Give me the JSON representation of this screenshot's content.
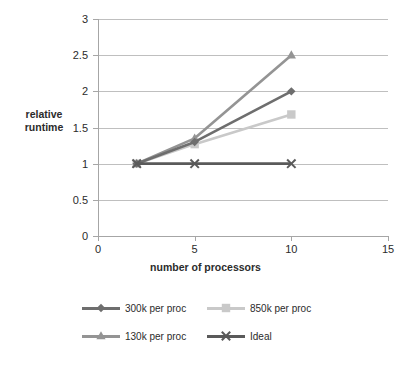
{
  "chart_data": {
    "type": "line",
    "title": "",
    "xlabel": "number of processors",
    "ylabel": "relative runtime",
    "x": [
      2,
      5,
      10
    ],
    "xlim": [
      0,
      15
    ],
    "ylim": [
      0,
      3
    ],
    "xticks": [
      "0",
      "5",
      "10",
      "15"
    ],
    "xtick_values": [
      0,
      5,
      10,
      15
    ],
    "yticks": [
      "0",
      "0.5",
      "1",
      "1.5",
      "2",
      "2.5",
      "3"
    ],
    "ytick_values": [
      0,
      0.5,
      1,
      1.5,
      2,
      2.5,
      3
    ],
    "grid": "horizontal",
    "legend_position": "bottom",
    "series": [
      {
        "name": "300k per proc",
        "values": [
          1,
          1.3,
          2
        ],
        "color": "#6e6e6e",
        "marker": "diamond"
      },
      {
        "name": "850k per proc",
        "values": [
          1,
          1.27,
          1.68
        ],
        "color": "#c9c9c9",
        "marker": "square"
      },
      {
        "name": "130k per proc",
        "values": [
          1,
          1.35,
          2.5
        ],
        "color": "#949494",
        "marker": "triangle"
      },
      {
        "name": "Ideal",
        "values": [
          1,
          1,
          1
        ],
        "color": "#5a5a5a",
        "marker": "x"
      }
    ]
  },
  "axes": {
    "y_title_line1": "relative",
    "y_title_line2": "runtime"
  }
}
